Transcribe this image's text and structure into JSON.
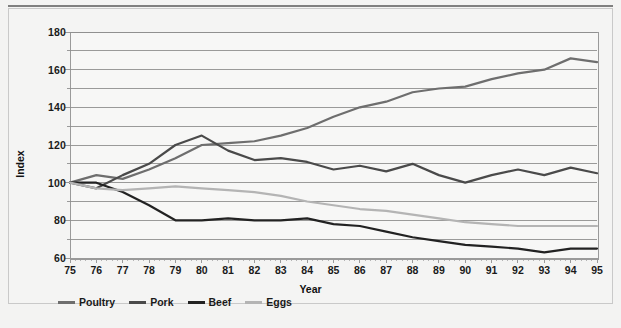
{
  "chart_data": {
    "type": "line",
    "title": "",
    "xlabel": "Year",
    "ylabel": "Index",
    "x": [
      75,
      76,
      77,
      78,
      79,
      80,
      81,
      82,
      83,
      84,
      85,
      86,
      87,
      88,
      89,
      90,
      91,
      92,
      93,
      94,
      95
    ],
    "categories": [
      "75",
      "76",
      "77",
      "78",
      "79",
      "80",
      "81",
      "82",
      "83",
      "84",
      "85",
      "86",
      "87",
      "88",
      "89",
      "90",
      "91",
      "92",
      "93",
      "94",
      "95"
    ],
    "xlim": [
      75,
      95
    ],
    "ylim": [
      60,
      180
    ],
    "ytick_labels": [
      "180",
      "160",
      "140",
      "120",
      "100",
      "80",
      "60"
    ],
    "ytick_values": [
      180,
      160,
      140,
      120,
      100,
      80,
      60
    ],
    "ytick_step": 20,
    "gridline_step": 10,
    "grid": true,
    "grid_axis": "y",
    "minor_ticks": true,
    "legend_position": "below-left",
    "series": [
      {
        "name": "Poultry",
        "color": "#6e6e6e",
        "values": [
          100,
          104,
          102,
          107,
          113,
          120,
          121,
          122,
          125,
          129,
          135,
          140,
          143,
          148,
          150,
          151,
          155,
          158,
          160,
          166,
          164
        ]
      },
      {
        "name": "Pork",
        "color": "#4a4a4a",
        "values": [
          100,
          97,
          104,
          110,
          120,
          125,
          117,
          112,
          113,
          111,
          107,
          109,
          106,
          110,
          104,
          100,
          104,
          107,
          104,
          108,
          105
        ]
      },
      {
        "name": "Beef",
        "color": "#222222",
        "values": [
          100,
          100,
          95,
          88,
          80,
          80,
          81,
          80,
          80,
          81,
          78,
          77,
          74,
          71,
          69,
          67,
          66,
          65,
          63,
          65,
          65
        ]
      },
      {
        "name": "Eggs",
        "color": "#b4b4b4",
        "values": [
          100,
          97,
          96,
          97,
          98,
          97,
          96,
          95,
          93,
          90,
          88,
          86,
          85,
          83,
          81,
          79,
          78,
          77,
          77,
          77,
          77
        ]
      }
    ]
  },
  "axes": {
    "y_title": "Index",
    "x_title": "Year"
  },
  "legend": {
    "items": [
      {
        "label": "Poultry",
        "color": "#6e6e6e"
      },
      {
        "label": "Pork",
        "color": "#4a4a4a"
      },
      {
        "label": "Beef",
        "color": "#222222"
      },
      {
        "label": "Eggs",
        "color": "#b4b4b4"
      }
    ]
  },
  "colors": {
    "background": "#f3f3f2",
    "plot_background": "#f7f7f6",
    "gridline": "#8f8f8f",
    "axis": "#9a9a9a",
    "text": "#1a1a1a"
  }
}
